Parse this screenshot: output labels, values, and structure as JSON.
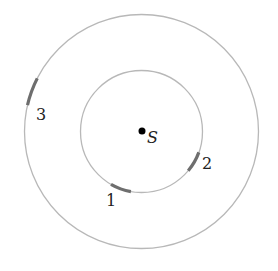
{
  "diagram": {
    "type": "orbital-positions",
    "center": {
      "x": 141.5,
      "y": 131.5
    },
    "star": {
      "label": "S"
    },
    "orbits": [
      {
        "name": "inner",
        "radius": 61
      },
      {
        "name": "outer",
        "radius": 117
      }
    ],
    "markers": [
      {
        "label": "1",
        "orbit": "inner",
        "start_deg": 100,
        "end_deg": 120,
        "label_pos": {
          "x": 106,
          "y": 206
        }
      },
      {
        "label": "2",
        "orbit": "inner",
        "start_deg": 20,
        "end_deg": 40,
        "label_pos": {
          "x": 202,
          "y": 169
        }
      },
      {
        "label": "3",
        "orbit": "outer",
        "start_deg": 193,
        "end_deg": 207,
        "label_pos": {
          "x": 36,
          "y": 120
        }
      }
    ],
    "colors": {
      "orbit": "#b8b8b8",
      "marker": "#6e6e6e",
      "star": "#000000"
    }
  }
}
